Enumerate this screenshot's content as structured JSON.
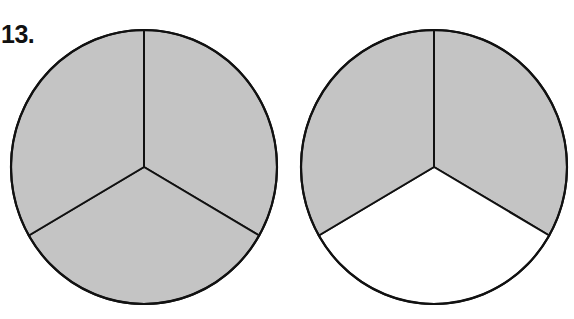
{
  "problem_number": "13.",
  "colors": {
    "shaded": "#c4c4c4",
    "unshaded": "#ffffff",
    "outline": "#111111"
  },
  "figures": [
    {
      "name": "circle-left",
      "parts": 3,
      "shaded": [
        true,
        true,
        true
      ]
    },
    {
      "name": "circle-right",
      "parts": 3,
      "shaded": [
        true,
        false,
        true
      ]
    }
  ]
}
